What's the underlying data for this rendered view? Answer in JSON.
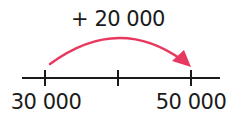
{
  "diagram": {
    "type": "number-line",
    "jump_label": "+ 20 000",
    "ticks": [
      {
        "value": 30000,
        "label": "30 000"
      },
      {
        "value": 40000,
        "label": ""
      },
      {
        "value": 50000,
        "label": "50 000"
      }
    ],
    "arrow": {
      "from": "30 000",
      "to": "50 000",
      "color": "#e8385f"
    },
    "line_color": "#1a1a1a"
  }
}
